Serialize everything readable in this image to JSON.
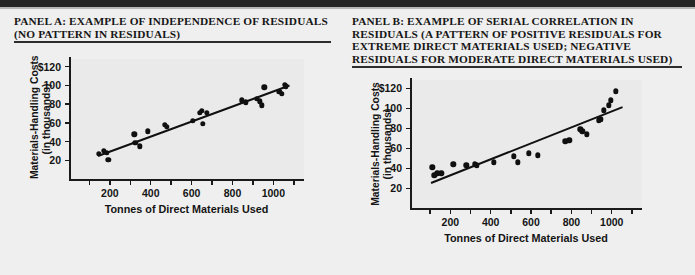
{
  "figure": {
    "background_color": "#efefef",
    "rule_color": "#262626"
  },
  "panels": [
    {
      "id": "panel-a",
      "title": "PANEL A: EXAMPLE OF INDEPENDENCE OF RESIDUALS (NO PATTERN IN RESIDUALS)",
      "chart_ref": 0
    },
    {
      "id": "panel-b",
      "title": "PANEL B: EXAMPLE OF SERIAL CORRELATION IN RESIDUALS (A PATTERN OF POSITIVE RESIDUALS FOR EXTREME DIRECT MATERIALS USED; NEGATIVE RESIDUALS FOR MODERATE DIRECT MATERIALS USED)",
      "chart_ref": 1
    }
  ],
  "chart_data": [
    {
      "type": "scatter",
      "title": "PANEL A: EXAMPLE OF INDEPENDENCE OF RESIDUALS (NO PATTERN IN RESIDUALS)",
      "xlabel": "Tonnes of Direct Materials Used",
      "ylabel": "Materials-Handling Costs (in thousands)",
      "ylabel_line1": "Materials-Handling Costs",
      "ylabel_line2": "(in thousands)",
      "xlim": [
        0,
        1150
      ],
      "ylim": [
        0,
        128
      ],
      "xticks": [
        100,
        200,
        300,
        400,
        500,
        600,
        700,
        800,
        900,
        1000,
        1100
      ],
      "xticklabels": [
        "",
        "200",
        "",
        "400",
        "",
        "600",
        "",
        "800",
        "",
        "1000",
        ""
      ],
      "yticks": [
        20,
        40,
        60,
        80,
        100,
        120
      ],
      "yticklabels": [
        "20",
        "40",
        "60",
        "80",
        "100",
        "$120"
      ],
      "grid": false,
      "legend": "none",
      "points": [
        {
          "x": 145,
          "y": 27
        },
        {
          "x": 170,
          "y": 30
        },
        {
          "x": 185,
          "y": 28
        },
        {
          "x": 192,
          "y": 21
        },
        {
          "x": 320,
          "y": 48
        },
        {
          "x": 325,
          "y": 39
        },
        {
          "x": 345,
          "y": 35
        },
        {
          "x": 385,
          "y": 51
        },
        {
          "x": 470,
          "y": 58
        },
        {
          "x": 480,
          "y": 56
        },
        {
          "x": 605,
          "y": 62
        },
        {
          "x": 640,
          "y": 71
        },
        {
          "x": 650,
          "y": 73
        },
        {
          "x": 655,
          "y": 59
        },
        {
          "x": 675,
          "y": 71
        },
        {
          "x": 845,
          "y": 84
        },
        {
          "x": 865,
          "y": 82
        },
        {
          "x": 920,
          "y": 86
        },
        {
          "x": 935,
          "y": 83
        },
        {
          "x": 945,
          "y": 79
        },
        {
          "x": 955,
          "y": 98
        },
        {
          "x": 1030,
          "y": 93
        },
        {
          "x": 1040,
          "y": 91
        },
        {
          "x": 1055,
          "y": 101
        },
        {
          "x": 1060,
          "y": 99
        }
      ],
      "fit_line": {
        "x1": 140,
        "y1": 26,
        "x2": 1075,
        "y2": 101
      }
    },
    {
      "type": "scatter",
      "title": "PANEL B: EXAMPLE OF SERIAL CORRELATION IN RESIDUALS",
      "xlabel": "Tonnes of Direct Materials Used",
      "ylabel": "Materials-Handling Costs (in thousands)",
      "ylabel_line1": "Materials-Handling Costs",
      "ylabel_line2": "(in thousands)",
      "xlim": [
        0,
        1150
      ],
      "ylim": [
        0,
        128
      ],
      "xticks": [
        100,
        200,
        300,
        400,
        500,
        600,
        700,
        800,
        900,
        1000,
        1100
      ],
      "xticklabels": [
        "",
        "200",
        "",
        "400",
        "",
        "600",
        "",
        "800",
        "",
        "1000",
        ""
      ],
      "yticks": [
        20,
        40,
        60,
        80,
        100,
        120
      ],
      "yticklabels": [
        "20",
        "40",
        "60",
        "80",
        "100",
        "$120"
      ],
      "grid": false,
      "legend": "none",
      "points": [
        {
          "x": 110,
          "y": 41
        },
        {
          "x": 120,
          "y": 33
        },
        {
          "x": 135,
          "y": 35
        },
        {
          "x": 155,
          "y": 35
        },
        {
          "x": 215,
          "y": 44
        },
        {
          "x": 280,
          "y": 43
        },
        {
          "x": 320,
          "y": 44
        },
        {
          "x": 330,
          "y": 43
        },
        {
          "x": 415,
          "y": 46
        },
        {
          "x": 515,
          "y": 52
        },
        {
          "x": 535,
          "y": 46
        },
        {
          "x": 590,
          "y": 55
        },
        {
          "x": 635,
          "y": 53
        },
        {
          "x": 770,
          "y": 67
        },
        {
          "x": 790,
          "y": 68
        },
        {
          "x": 845,
          "y": 79
        },
        {
          "x": 855,
          "y": 77
        },
        {
          "x": 875,
          "y": 74
        },
        {
          "x": 935,
          "y": 88
        },
        {
          "x": 945,
          "y": 89
        },
        {
          "x": 960,
          "y": 98
        },
        {
          "x": 985,
          "y": 103
        },
        {
          "x": 995,
          "y": 108
        },
        {
          "x": 1020,
          "y": 117
        }
      ],
      "fit_line": {
        "x1": 105,
        "y1": 26,
        "x2": 1055,
        "y2": 102
      }
    }
  ]
}
